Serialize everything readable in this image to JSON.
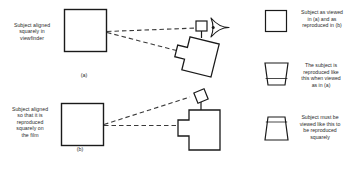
{
  "figure": {
    "type": "technical-illustration",
    "background_color": "#ffffff",
    "ink_color": "#1a1a1a",
    "text_color": "#2b2b2b"
  },
  "panels": [
    {
      "id": "a",
      "label": "(a)",
      "caption": "Subject aligned\nsquarely in\nviewfinder",
      "subject_shape": "square",
      "camera_orientation": "tilted",
      "viewfinder_orientation": "upright",
      "eye_present": true,
      "sight_lines": 2
    },
    {
      "id": "b",
      "label": "(b)",
      "caption": "Subject aligned\nso that it is\nreproduced\nsquarely on\nthe film",
      "subject_shape": "square",
      "camera_orientation": "upright",
      "viewfinder_orientation": "tilted",
      "eye_present": false,
      "sight_lines": 2
    }
  ],
  "legend": {
    "items": [
      {
        "shape": "square",
        "text": "Subject as viewed\nin (a) and as\nreproduced in (b)"
      },
      {
        "shape": "trapezoid-narrow-bottom",
        "text": "The subject is\nreproduced like\nthis when viewed\nas in (a)"
      },
      {
        "shape": "trapezoid-wide-bottom",
        "text": "Subject must be\nviewed like this to\nbe reproduced\nsquarely"
      }
    ]
  }
}
